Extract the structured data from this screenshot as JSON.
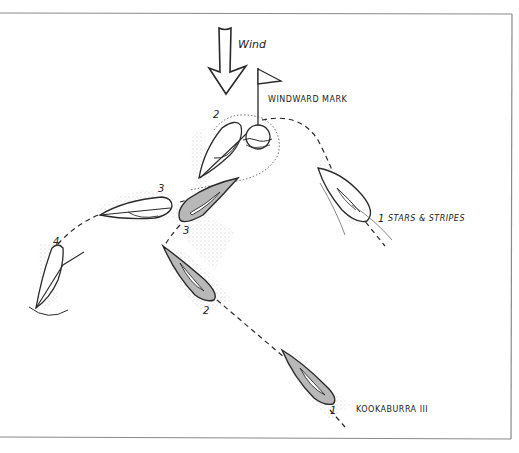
{
  "diagram": {
    "wind_label": "Wind",
    "mark_label": "WINDWARD MARK",
    "boats": {
      "stars_and_stripes": {
        "name": "STARS & STRIPES",
        "positions": [
          "1",
          "2",
          "3",
          "4"
        ]
      },
      "kookaburra": {
        "name": "KOOKABURRA III",
        "positions": [
          "1",
          "2",
          "3"
        ]
      }
    },
    "labels": {
      "ss_pos1": "1",
      "ss_pos2": "2",
      "ss_pos3": "3",
      "ss_pos4": "4",
      "kk_pos1": "1",
      "kk_pos2": "2",
      "kk_pos3": "3"
    },
    "colors": {
      "line": "#2a2a2a",
      "hull_white": "#ffffff",
      "hull_gray": "#b8b8b8",
      "frame": "#888888"
    }
  }
}
